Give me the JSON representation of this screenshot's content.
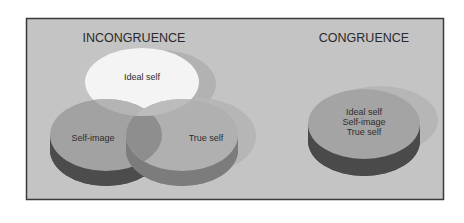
{
  "diagram": {
    "panels": [
      {
        "title": "INCONGRUENCE",
        "circles": [
          {
            "label": "Ideal self"
          },
          {
            "label": "Self-image"
          },
          {
            "label": "True self"
          }
        ]
      },
      {
        "title": "CONGRUENCE",
        "labels": [
          "Ideal self",
          "Self-image",
          "True self"
        ]
      }
    ],
    "colors": {
      "background": "#c4c4c4",
      "frame_border": "#3a3a3a",
      "ideal_top": "#f4f4f4",
      "disc_top": "#a4a4a4",
      "disc_side_dark": "#4c4c4c",
      "overlap": "#8e8e8e",
      "shadow": "#b2b2b2"
    }
  }
}
